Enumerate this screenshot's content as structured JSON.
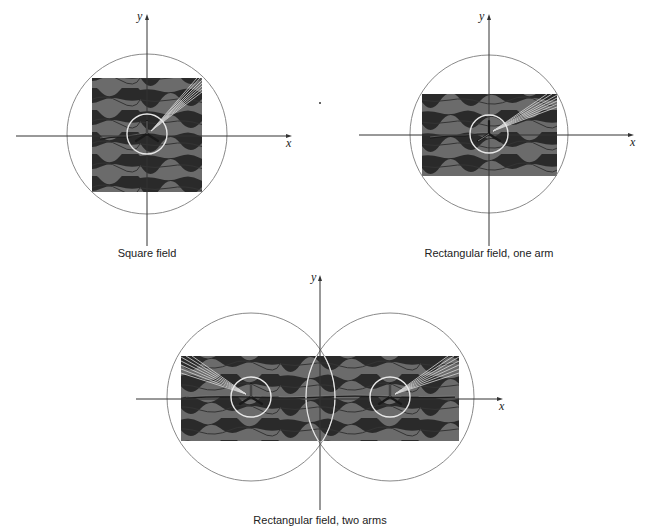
{
  "figure": {
    "panels": [
      {
        "id": "square",
        "caption": "Square field",
        "x_axis_label": "x",
        "y_axis_label": "y",
        "field_shape": "square",
        "arms": 1
      },
      {
        "id": "rect-one-arm",
        "caption": "Rectangular field, one arm",
        "x_axis_label": "x",
        "y_axis_label": "y",
        "field_shape": "rectangle",
        "arms": 1
      },
      {
        "id": "rect-two-arms",
        "caption": "Rectangular field, two arms",
        "x_axis_label": "x",
        "y_axis_label": "y",
        "field_shape": "rectangle",
        "arms": 2
      }
    ],
    "colors": {
      "field_dark": "#2a2a2a",
      "field_light": "#6b6b6b",
      "boundary_circle": "#8a8a8a",
      "hub_ring": "#e8e8e8",
      "axis": "#333333"
    }
  }
}
